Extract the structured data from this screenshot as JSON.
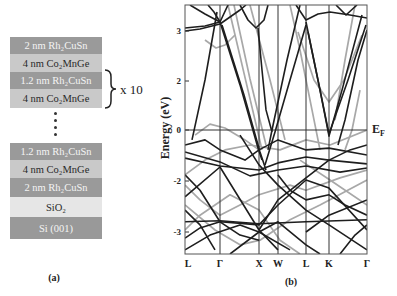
{
  "panel_a": {
    "label": "(a)",
    "layers": [
      {
        "label": "2 nm Rh₂CuSn",
        "type": "dark"
      },
      {
        "label": "4 nm Co₂MnGe",
        "type": "light"
      },
      {
        "label": "1.2 nm Rh₂CuSn",
        "type": "dark"
      },
      {
        "label": "4 nm Co₂MnGe",
        "type": "light"
      },
      {
        "label": "1.2 nm Rh₂CuSn",
        "type": "dark"
      },
      {
        "label": "4 nm Co₂MnGe",
        "type": "light"
      },
      {
        "label": "2 nm Rh₂CuSn",
        "type": "dark"
      },
      {
        "label": "SiO₂",
        "type": "sio2"
      },
      {
        "label": "Si (001)",
        "type": "si"
      }
    ],
    "repeat_label": "x 10",
    "colors": {
      "rh2cusn": "#9a9a9a",
      "co2mnge": "#c9c9c9",
      "sio2": "#e6e6e6",
      "si": "#999999"
    }
  },
  "panel_b": {
    "label": "(b)",
    "fermi_label": "E",
    "fermi_sub": "F"
  },
  "chart_data": {
    "type": "line",
    "title": "",
    "xlabel": "",
    "ylabel": "Energy (eV)",
    "x_ticks": [
      {
        "label": "L",
        "k": 0
      },
      {
        "label": "Γ",
        "k": 35
      },
      {
        "label": "X",
        "k": 74
      },
      {
        "label": "W",
        "k": 93
      },
      {
        "label": "L",
        "k": 121
      },
      {
        "label": "K",
        "k": 144
      },
      {
        "label": "Γ",
        "k": 182
      }
    ],
    "y_ticks": [
      "3",
      "2",
      "0",
      "-2",
      "-3"
    ],
    "ylim": [
      -3.43,
      3.52
    ],
    "xlim": [
      0,
      182
    ],
    "grid": false,
    "annotations": [
      "E_F at 0 eV"
    ],
    "series_colors": {
      "black": "#1e1e1e",
      "gray": "#a8a8a8"
    },
    "bands_gray": [
      [
        [
          43,
          3.52
        ],
        [
          77,
          -0.78
        ]
      ],
      [
        [
          49,
          3.52
        ],
        [
          65,
          2.04
        ],
        [
          81,
          -0.59
        ]
      ],
      [
        [
          20,
          2.82
        ],
        [
          31,
          2.66
        ],
        [
          40,
          2.72
        ],
        [
          50,
          2.92
        ]
      ],
      [
        [
          113,
          2.98
        ],
        [
          129,
          2.02
        ],
        [
          144,
          1.14
        ],
        [
          159,
          2.02
        ],
        [
          177,
          2.92
        ]
      ],
      [
        [
          105,
          3.52
        ],
        [
          115,
          2.62
        ],
        [
          127,
          0.82
        ],
        [
          135,
          -0.78
        ]
      ],
      [
        [
          10,
          -0.2
        ],
        [
          25,
          0.24
        ],
        [
          40,
          0.08
        ],
        [
          60,
          -0.39
        ],
        [
          74,
          -0.78
        ]
      ],
      [
        [
          0,
          -1.76
        ],
        [
          20,
          -1.18
        ],
        [
          40,
          -0.78
        ],
        [
          65,
          -0.59
        ],
        [
          95,
          -0.78
        ],
        [
          121,
          -0.39
        ],
        [
          145,
          -0.59
        ],
        [
          182,
          0.0
        ]
      ],
      [
        [
          0,
          -2.08
        ],
        [
          15,
          -2.37
        ],
        [
          35,
          -2.67
        ],
        [
          55,
          -2.47
        ],
        [
          74,
          -2.27
        ],
        [
          105,
          -2.08
        ],
        [
          121,
          -2.18
        ],
        [
          155,
          -1.88
        ],
        [
          182,
          -1.57
        ]
      ],
      [
        [
          0,
          -2.47
        ],
        [
          30,
          -2.96
        ],
        [
          55,
          -3.25
        ],
        [
          75,
          -3.16
        ],
        [
          105,
          -2.76
        ],
        [
          135,
          -2.47
        ],
        [
          182,
          -1.96
        ]
      ],
      [
        [
          65,
          3.52
        ],
        [
          85,
          2.02
        ],
        [
          100,
          -0.39
        ]
      ],
      [
        [
          170,
          3.52
        ],
        [
          160,
          2.42
        ],
        [
          150,
          0.41
        ]
      ],
      [
        [
          0,
          -2.96
        ],
        [
          15,
          -2.67
        ],
        [
          45,
          -2.27
        ],
        [
          74,
          -2.57
        ],
        [
          95,
          -3.16
        ],
        [
          115,
          -3.43
        ]
      ],
      [
        [
          115,
          -1.18
        ],
        [
          145,
          -1.96
        ],
        [
          182,
          -2.47
        ]
      ],
      [
        [
          175,
          1.63
        ],
        [
          167,
          0.0
        ],
        [
          160,
          -0.78
        ]
      ]
    ],
    "bands_black": [
      [
        [
          0,
          3.0
        ],
        [
          15,
          3.04
        ],
        [
          35,
          3.14
        ],
        [
          55,
          3.42
        ],
        [
          61,
          3.52
        ]
      ],
      [
        [
          0,
          3.06
        ],
        [
          20,
          3.1
        ],
        [
          35,
          3.18
        ],
        [
          43,
          3.52
        ]
      ],
      [
        [
          5,
          3.52
        ],
        [
          20,
          3.34
        ],
        [
          35,
          3.18
        ]
      ],
      [
        [
          23,
          3.52
        ],
        [
          29,
          3.38
        ],
        [
          35,
          3.18
        ]
      ],
      [
        [
          35,
          3.18
        ],
        [
          55,
          1.84
        ],
        [
          73,
          -0.71
        ],
        [
          77,
          -1.18
        ]
      ],
      [
        [
          37,
          3.12
        ],
        [
          59,
          1.43
        ],
        [
          75,
          -0.86
        ],
        [
          81,
          -1.57
        ]
      ],
      [
        [
          7,
          -0.39
        ],
        [
          20,
          2.02
        ],
        [
          32,
          3.38
        ]
      ],
      [
        [
          55,
          3.52
        ],
        [
          63,
          3.22
        ],
        [
          71,
          3.06
        ],
        [
          79,
          3.22
        ],
        [
          83,
          3.52
        ]
      ],
      [
        [
          73,
          3.06
        ],
        [
          77,
          2.22
        ],
        [
          81,
          0.82
        ],
        [
          87,
          -0.08
        ]
      ],
      [
        [
          121,
          3.12
        ],
        [
          105,
          2.02
        ],
        [
          90,
          -0.08
        ],
        [
          80,
          -1.37
        ]
      ],
      [
        [
          115,
          3.52
        ],
        [
          102,
          2.42
        ],
        [
          87,
          0.0
        ],
        [
          83,
          -0.78
        ]
      ],
      [
        [
          121,
          3.18
        ],
        [
          133,
          2.02
        ],
        [
          144,
          -0.16
        ],
        [
          163,
          2.02
        ],
        [
          181,
          3.12
        ]
      ],
      [
        [
          123,
          2.98
        ],
        [
          135,
          1.63
        ],
        [
          144,
          -0.24
        ],
        [
          157,
          1.63
        ],
        [
          177,
          3.32
        ]
      ],
      [
        [
          111,
          3.52
        ],
        [
          121,
          3.22
        ],
        [
          133,
          3.34
        ],
        [
          145,
          3.38
        ],
        [
          165,
          3.32
        ],
        [
          182,
          3.26
        ]
      ],
      [
        [
          151,
          3.52
        ],
        [
          161,
          3.32
        ],
        [
          172,
          3.52
        ]
      ],
      [
        [
          182,
          3.02
        ],
        [
          173,
          2.42
        ],
        [
          160,
          0.41
        ],
        [
          153,
          -0.59
        ]
      ],
      [
        [
          0,
          -1.1
        ],
        [
          35,
          -1.41
        ],
        [
          74,
          -1.57
        ],
        [
          93,
          -1.29
        ],
        [
          121,
          -1.06
        ],
        [
          144,
          -1.18
        ],
        [
          182,
          -1.33
        ]
      ],
      [
        [
          0,
          -0.86
        ],
        [
          35,
          -1.25
        ],
        [
          65,
          -1.8
        ],
        [
          93,
          -1.57
        ],
        [
          121,
          -1.41
        ],
        [
          155,
          -1.65
        ],
        [
          182,
          -1.49
        ]
      ],
      [
        [
          0,
          -2.31
        ],
        [
          35,
          -1.45
        ],
        [
          74,
          -2.96
        ],
        [
          93,
          -3.35
        ]
      ],
      [
        [
          0,
          -1.76
        ],
        [
          15,
          -2.18
        ],
        [
          35,
          -2.8
        ],
        [
          55,
          -3.06
        ],
        [
          74,
          -3.16
        ]
      ],
      [
        [
          0,
          -3.12
        ],
        [
          15,
          -2.92
        ],
        [
          35,
          -2.8
        ],
        [
          74,
          -2.86
        ],
        [
          93,
          -2.47
        ],
        [
          121,
          -1.96
        ],
        [
          144,
          -2.14
        ],
        [
          182,
          -2.96
        ]
      ],
      [
        [
          0,
          -3.35
        ],
        [
          25,
          -3.06
        ],
        [
          55,
          -2.86
        ],
        [
          74,
          -3.0
        ],
        [
          105,
          -3.35
        ]
      ],
      [
        [
          74,
          -2.96
        ],
        [
          93,
          -2.37
        ],
        [
          121,
          -1.88
        ],
        [
          144,
          -1.18
        ],
        [
          165,
          -0.78
        ],
        [
          182,
          -0.59
        ]
      ],
      [
        [
          55,
          -0.2
        ],
        [
          74,
          -1.37
        ],
        [
          93,
          -2.08
        ],
        [
          121,
          -2.57
        ],
        [
          144,
          -2.86
        ],
        [
          182,
          -3.35
        ]
      ],
      [
        [
          121,
          -3.0
        ],
        [
          144,
          -2.67
        ],
        [
          182,
          -2.37
        ]
      ],
      [
        [
          0,
          -0.59
        ],
        [
          20,
          -0.39
        ],
        [
          35,
          -0.78
        ],
        [
          60,
          -1.18
        ],
        [
          74,
          -0.78
        ],
        [
          93,
          -0.39
        ],
        [
          121,
          -0.78
        ],
        [
          144,
          -0.71
        ],
        [
          182,
          -0.98
        ]
      ],
      [
        [
          0,
          -2.57
        ],
        [
          15,
          -2.86
        ],
        [
          30,
          -3.35
        ]
      ],
      [
        [
          93,
          -1.76
        ],
        [
          105,
          -2.18
        ],
        [
          121,
          -2.37
        ],
        [
          144,
          -2.27
        ],
        [
          160,
          -2.47
        ],
        [
          182,
          -2.67
        ]
      ],
      [
        [
          45,
          -3.43
        ],
        [
          74,
          -3.0
        ],
        [
          93,
          -2.8
        ],
        [
          121,
          -3.25
        ],
        [
          135,
          -3.43
        ]
      ],
      [
        [
          155,
          -3.43
        ],
        [
          170,
          -3.06
        ],
        [
          182,
          -2.86
        ]
      ],
      [
        [
          0,
          -2.8
        ],
        [
          35,
          -2.78
        ],
        [
          74,
          -2.84
        ],
        [
          121,
          -2.8
        ],
        [
          182,
          -2.76
        ]
      ]
    ]
  }
}
